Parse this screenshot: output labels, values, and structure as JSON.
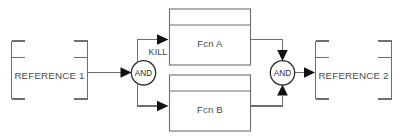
{
  "diagram": {
    "type": "logic-block-diagram",
    "orientation": "left-to-right",
    "canvas": {
      "width": 401,
      "height": 139,
      "background": "#ffffff"
    },
    "colors": {
      "line": "#6e6e6e",
      "gate_stroke": "#2b2b2b",
      "arrow_fill": "#111111",
      "text": "#4a4a4a",
      "background": "#ffffff"
    },
    "nodes": {
      "reference_in": {
        "label": "REFERENCE 1",
        "shape": "corner-bracket",
        "role": "input-reference"
      },
      "gate_in": {
        "label": "AND",
        "shape": "circle",
        "role": "and-gate"
      },
      "kill_annotation": {
        "label": "KILL"
      },
      "function_a": {
        "label": "Fcn A",
        "shape": "rect-with-header",
        "role": "function-block"
      },
      "function_b": {
        "label": "Fcn B",
        "shape": "rect-with-header",
        "role": "function-block"
      },
      "gate_out": {
        "label": "AND",
        "shape": "circle",
        "role": "and-gate"
      },
      "reference_out": {
        "label": "REFERENCE 2",
        "shape": "corner-bracket",
        "role": "output-reference"
      }
    },
    "edges": [
      {
        "from": "reference_in",
        "to": "gate_in",
        "label": ""
      },
      {
        "from": "gate_in",
        "to": "function_a",
        "label": "KILL"
      },
      {
        "from": "gate_in",
        "to": "function_b",
        "label": ""
      },
      {
        "from": "function_a",
        "to": "gate_out",
        "label": ""
      },
      {
        "from": "function_b",
        "to": "gate_out",
        "label": ""
      },
      {
        "from": "gate_out",
        "to": "reference_out",
        "label": ""
      }
    ]
  }
}
